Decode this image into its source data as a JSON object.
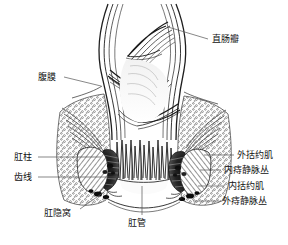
{
  "figure": {
    "kind": "anatomical-line-drawing",
    "background_color": "#ffffff",
    "ink_color": "#1a1a1a",
    "leader_line_color": "#555555"
  },
  "labels": [
    {
      "id": "rectal-valve",
      "text": "直肠瓣",
      "side": "right",
      "x": 212,
      "y": 34,
      "leader_from_x": 208,
      "leader_from_y": 39,
      "leader_to_x": 168,
      "leader_to_y": 27
    },
    {
      "id": "peritoneum",
      "text": "腹膜",
      "side": "left",
      "x": 38,
      "y": 72,
      "leader_from_x": 64,
      "leader_from_y": 77,
      "leader_to_x": 101,
      "leader_to_y": 86
    },
    {
      "id": "anal-columns",
      "text": "肛柱",
      "side": "left",
      "x": 14,
      "y": 152,
      "leader_from_x": 38,
      "leader_from_y": 157,
      "leader_to_x": 101,
      "leader_to_y": 157
    },
    {
      "id": "dentate-line",
      "text": "齿线",
      "side": "left",
      "x": 14,
      "y": 172,
      "leader_from_x": 38,
      "leader_from_y": 177,
      "leader_to_x": 118,
      "leader_to_y": 177
    },
    {
      "id": "anal-crypt",
      "text": "肛隐窝",
      "side": "left",
      "x": 44,
      "y": 208,
      "leader_from_x": 80,
      "leader_from_y": 209,
      "leader_to_x": 104,
      "leader_to_y": 192
    },
    {
      "id": "anal-canal",
      "text": "肛管",
      "side": "bottom",
      "x": 128,
      "y": 218,
      "leader_from_x": 142,
      "leader_from_y": 215,
      "leader_to_x": 142,
      "leader_to_y": 186
    },
    {
      "id": "external-sphincter",
      "text": "外括约肌",
      "side": "right",
      "x": 237,
      "y": 150,
      "leader_from_x": 234,
      "leader_from_y": 155,
      "leader_to_x": 204,
      "leader_to_y": 155
    },
    {
      "id": "internal-hemorrhoidal-plexus",
      "text": "内痔静脉丛",
      "side": "right",
      "x": 224,
      "y": 165,
      "leader_from_x": 221,
      "leader_from_y": 170,
      "leader_to_x": 200,
      "leader_to_y": 170
    },
    {
      "id": "internal-sphincter",
      "text": "内括约肌",
      "side": "right",
      "x": 228,
      "y": 181,
      "leader_from_x": 224,
      "leader_from_y": 186,
      "leader_to_x": 198,
      "leader_to_y": 186
    },
    {
      "id": "external-hemorrhoidal-plexus",
      "text": "外痔静脉丛",
      "side": "right",
      "x": 222,
      "y": 196,
      "leader_from_x": 219,
      "leader_from_y": 201,
      "leader_to_x": 193,
      "leader_to_y": 201
    }
  ]
}
